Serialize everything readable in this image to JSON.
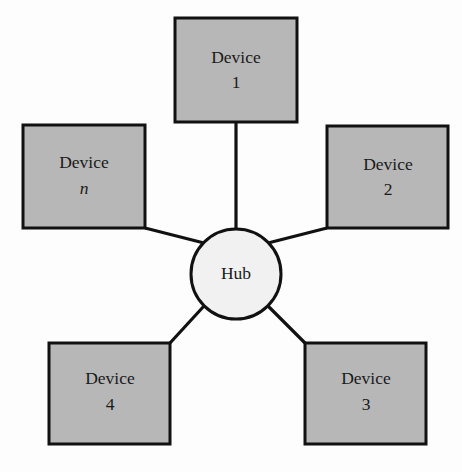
{
  "diagram": {
    "type": "star-topology-network-diagram",
    "background_color": "#fdfdfd",
    "stroke_color": "#111111",
    "device_fill_color": "#b7b7b7",
    "hub_fill_color": "#f1f1f1",
    "hub": {
      "label": "Hub",
      "cx": 236,
      "cy": 274,
      "r": 45
    },
    "devices": [
      {
        "id": "device-1",
        "label_line1": "Device",
        "label_line2": "1",
        "italic_line2": false,
        "x": 175,
        "y": 18,
        "width": 122,
        "height": 104,
        "link_from_x": 236,
        "link_from_y": 122,
        "link_to_x": 236,
        "link_to_y": 229
      },
      {
        "id": "device-2",
        "label_line1": "Device",
        "label_line2": "2",
        "italic_line2": false,
        "x": 327,
        "y": 126,
        "width": 121,
        "height": 102,
        "link_from_x": 327,
        "link_from_y": 228,
        "link_to_x": 268,
        "link_to_y": 242
      },
      {
        "id": "device-3",
        "label_line1": "Device",
        "label_line2": "3",
        "italic_line2": false,
        "x": 305,
        "y": 343,
        "width": 121,
        "height": 101,
        "link_from_x": 305,
        "link_from_y": 343,
        "link_to_x": 268,
        "link_to_y": 306
      },
      {
        "id": "device-4",
        "label_line1": "Device",
        "label_line2": "4",
        "italic_line2": false,
        "x": 49,
        "y": 343,
        "width": 121,
        "height": 101,
        "link_from_x": 170,
        "link_from_y": 343,
        "link_to_x": 204,
        "link_to_y": 306
      },
      {
        "id": "device-n",
        "label_line1": "Device",
        "label_line2": "n",
        "italic_line2": true,
        "x": 23,
        "y": 125,
        "width": 122,
        "height": 103,
        "link_from_x": 145,
        "link_from_y": 228,
        "link_to_x": 204,
        "link_to_y": 242
      }
    ]
  }
}
